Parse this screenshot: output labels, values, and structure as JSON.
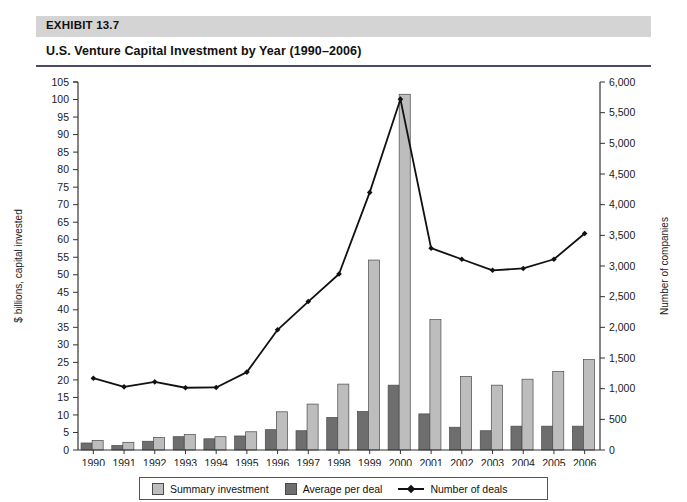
{
  "header": {
    "exhibit_label": "EXHIBIT 13.7",
    "title": "U.S. Venture Capital Investment by Year (1990–2006)"
  },
  "legend": {
    "items": [
      {
        "label": "Summary investment",
        "type": "swatch",
        "color": "#bdbdbd"
      },
      {
        "label": "Average per deal",
        "type": "swatch",
        "color": "#6e6e6e"
      },
      {
        "label": "Number of deals",
        "type": "line",
        "color": "#111111"
      }
    ]
  },
  "colors": {
    "summary_investment": "#bdbdbd",
    "average_per_deal": "#6e6e6e",
    "number_of_deals": "#111111",
    "band": "#d4d4d4",
    "rule": "#4a4a6a",
    "axis": "#333333"
  },
  "chart_data": {
    "type": "bar",
    "title": "U.S. Venture Capital Investment by Year (1990–2006)",
    "xlabel": "",
    "ylabel": "$ billions, capital invested",
    "y2label": "Number of companies",
    "ylim": [
      0,
      105
    ],
    "y2lim": [
      0,
      6000
    ],
    "ytick_step": 5,
    "y2tick_step": 500,
    "grid": false,
    "legend_position": "bottom",
    "categories": [
      "1990",
      "1991",
      "1992",
      "1993",
      "1994",
      "1995",
      "1996",
      "1997",
      "1998",
      "1999",
      "2000",
      "2001",
      "2002",
      "2003",
      "2004",
      "2005",
      "2006"
    ],
    "yticks": [
      0,
      5,
      10,
      15,
      20,
      25,
      30,
      35,
      40,
      45,
      50,
      55,
      60,
      65,
      70,
      75,
      80,
      85,
      90,
      95,
      100,
      105
    ],
    "ytick_labels": [
      "0",
      "5",
      "10",
      "15",
      "20",
      "25",
      "30",
      "35",
      "40",
      "45",
      "50",
      "55",
      "60",
      "65",
      "70",
      "75",
      "80",
      "85",
      "90",
      "95",
      "100",
      "105"
    ],
    "y2ticks": [
      0,
      500,
      1000,
      1500,
      2000,
      2500,
      3000,
      3500,
      4000,
      4500,
      5000,
      5500,
      6000
    ],
    "y2tick_labels": [
      "0",
      "500",
      "1,000",
      "1,500",
      "2,000",
      "2,500",
      "3,000",
      "3,500",
      "4,000",
      "4,500",
      "5,000",
      "5,500",
      "6,000"
    ],
    "series": [
      {
        "name": "Average per deal",
        "type": "bar",
        "axis": "left",
        "color": "#6e6e6e",
        "values": [
          2.0,
          1.3,
          2.5,
          3.8,
          3.2,
          4.0,
          5.8,
          5.5,
          9.3,
          11.0,
          18.5,
          10.3,
          6.5,
          5.5,
          6.8,
          6.8,
          6.8
        ]
      },
      {
        "name": "Summary investment",
        "type": "bar",
        "axis": "left",
        "color": "#bdbdbd",
        "values": [
          2.7,
          2.2,
          3.6,
          4.4,
          3.8,
          5.2,
          10.9,
          13.1,
          18.8,
          54.2,
          101.5,
          37.2,
          21.0,
          18.5,
          20.2,
          22.4,
          25.8
        ]
      },
      {
        "name": "Number of deals",
        "type": "line",
        "axis": "right",
        "color": "#111111",
        "marker": "diamond",
        "values": [
          1170,
          1030,
          1110,
          1015,
          1020,
          1270,
          1960,
          2420,
          2870,
          4200,
          5720,
          3290,
          3110,
          2930,
          2960,
          3110,
          3530
        ]
      }
    ]
  }
}
